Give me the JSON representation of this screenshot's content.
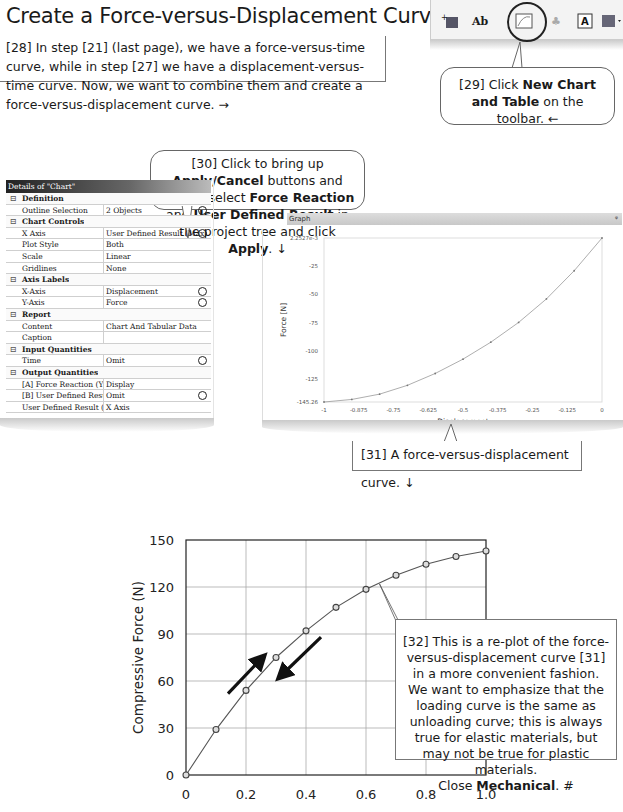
{
  "page": {
    "title": "Create a Force-versus-Displacement Curve",
    "step28": "[28] In step [21] (last page), we have a force-versus-time curve, while in step [27] we have a displacement-versus-time curve.  Now, we want to combine them and create a force-versus-displacement curve.  →"
  },
  "toolbar": {
    "icons": [
      "new-section-plane-icon",
      "new-annotation-icon",
      "new-chart-and-table-icon",
      "comment-icon",
      "text-icon",
      "image-dropdown-icon"
    ],
    "highlighted": "new-chart-and-table-icon"
  },
  "callouts": {
    "step29": {
      "pre": "[29] Click ",
      "bold": "New Chart and Table",
      "post": " on the toolbar.  ←"
    },
    "step30": {
      "p1": "[30] Click to bring up ",
      "b1": "Apply/Cancel",
      "p2": " buttons and control-select ",
      "b2": "Force Reaction",
      "p3": " and ",
      "b3": "User Defined Result",
      "p4": " in the project tree and click ",
      "b4": "Apply",
      "p5": ".  ↓"
    },
    "step31": "[31] A force-versus-displacement curve.  ↓",
    "step32": {
      "text": "[32] This is a re-plot of the force-versus-displacement curve [31] in a more convenient fashion.  We want to emphasize that the loading curve is the same as unloading curve; this is always true for elastic materials, but may not be true for plastic materials.",
      "close_pre": "Close ",
      "close_bold": "Mechanical",
      "close_post": ".  #"
    }
  },
  "details": {
    "header": "Details of \"Chart\"",
    "rows": [
      {
        "type": "cat",
        "label": "Definition"
      },
      {
        "type": "row",
        "key": "Outline Selection",
        "value": "2 Objects",
        "circle": true
      },
      {
        "type": "cat",
        "label": "Chart Controls"
      },
      {
        "type": "row",
        "key": "X Axis",
        "value": "User Defined Result (Max)",
        "circle": true
      },
      {
        "type": "row",
        "key": "Plot Style",
        "value": "Both"
      },
      {
        "type": "row",
        "key": "Scale",
        "value": "Linear"
      },
      {
        "type": "row",
        "key": "Gridlines",
        "value": "None"
      },
      {
        "type": "cat",
        "label": "Axis Labels"
      },
      {
        "type": "row",
        "key": "X-Axis",
        "value": "Displacement",
        "circle": true
      },
      {
        "type": "row",
        "key": "Y-Axis",
        "value": "Force",
        "circle": true
      },
      {
        "type": "cat",
        "label": "Report"
      },
      {
        "type": "row",
        "key": "Content",
        "value": "Chart And Tabular Data"
      },
      {
        "type": "row",
        "key": "Caption",
        "value": ""
      },
      {
        "type": "cat",
        "label": "Input Quantities"
      },
      {
        "type": "row",
        "key": "Time",
        "value": "Omit",
        "circle": true
      },
      {
        "type": "cat",
        "label": "Output Quantities"
      },
      {
        "type": "row",
        "key": "[A] Force Reaction  (Y)",
        "value": "Display"
      },
      {
        "type": "row",
        "key": "[B] User Defined Result (Min)",
        "value": "Omit",
        "circle": true
      },
      {
        "type": "row",
        "key": "User Defined Result (Max)",
        "value": "X Axis"
      }
    ]
  },
  "graph": {
    "panel_title": "Graph",
    "pin": "ᵠ",
    "xlabel": "Displacement",
    "ylabel": "Force [N]",
    "yticks": [
      "2.2527e-3",
      "-25",
      "-50",
      "-75",
      "-100",
      "-125",
      "-145.26"
    ],
    "xticks": [
      "-1",
      "-0.875",
      "-0.75",
      "-0.625",
      "-0.5",
      "-0.375",
      "-0.25",
      "-0.125",
      "0"
    ]
  },
  "chart_data": [
    {
      "type": "line",
      "title": "Graph",
      "xlabel": "Displacement",
      "ylabel": "Force [N]",
      "x": [
        -1,
        -0.9,
        -0.8,
        -0.7,
        -0.6,
        -0.5,
        -0.4,
        -0.3,
        -0.2,
        -0.1,
        0
      ],
      "values": [
        -145.26,
        -143.0,
        -138.3,
        -130.5,
        -120.0,
        -107.3,
        -92.3,
        -74.8,
        -54.0,
        -29.0,
        0.0022527
      ],
      "xlim": [
        -1,
        0
      ],
      "ylim": [
        -145.26,
        0.0022527
      ],
      "grid": false,
      "markers": true
    },
    {
      "type": "line",
      "title": "",
      "xlabel": "",
      "ylabel": "Compressive Force (N)",
      "x": [
        0,
        0.1,
        0.2,
        0.3,
        0.4,
        0.5,
        0.6,
        0.7,
        0.8,
        0.9,
        1.0
      ],
      "values": [
        0,
        29,
        54,
        75,
        92,
        107,
        118.5,
        127.5,
        134.5,
        139.5,
        143
      ],
      "xticks": [
        "0",
        "0.2",
        "0.4",
        "0.6",
        "0.8",
        "1.0"
      ],
      "yticks": [
        "0",
        "30",
        "60",
        "90",
        "120",
        "150"
      ],
      "xlim": [
        0,
        1.0
      ],
      "ylim": [
        0,
        150
      ],
      "grid": true,
      "markers": true,
      "annotations": [
        "loading arrow (up)",
        "unloading arrow (down)"
      ]
    }
  ]
}
